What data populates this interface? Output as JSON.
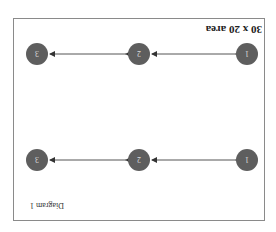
{
  "diagram": {
    "title": "30 x 20 area",
    "caption": "Diagram 1",
    "orientation": "rotated 180 degrees",
    "colors": {
      "node_fill": "#5e5e5e",
      "node_text": "#dcdcdc",
      "edge": "#555555",
      "border": "#8a8a8a"
    },
    "rows": [
      {
        "nodes": [
          {
            "label": "1"
          },
          {
            "label": "2"
          },
          {
            "label": "3"
          }
        ],
        "edges": [
          {
            "from": "1",
            "to": "2",
            "type": "bidirectional"
          },
          {
            "from": "2",
            "to": "3",
            "type": "bidirectional"
          }
        ]
      },
      {
        "nodes": [
          {
            "label": "1"
          },
          {
            "label": "2"
          },
          {
            "label": "3"
          }
        ],
        "edges": [
          {
            "from": "1",
            "to": "2",
            "type": "bidirectional"
          },
          {
            "from": "2",
            "to": "3",
            "type": "bidirectional"
          }
        ]
      }
    ]
  }
}
